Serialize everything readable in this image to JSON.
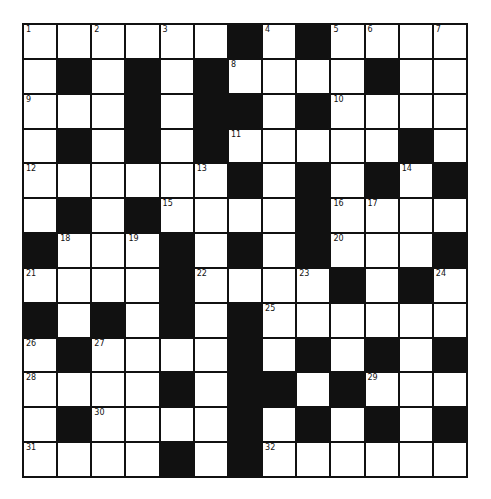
{
  "puzzle": {
    "rows": 13,
    "cols": 13,
    "colors": {
      "black": "#111111",
      "white": "#ffffff"
    },
    "layout": [
      "......#.#....",
      ".#.#.#....#.",
      "...#.##.#....",
      ".#.#.#.....#.",
      "......#.#.#.#",
      ".#.#....#....",
      "#...#.#.#...#",
      "....#....#.#.",
      "#.#.#.#......",
      ".#....#.#.#.#",
      "....#.##.#...",
      ".#....#.#.#.#",
      "....#.#......"
    ],
    "numbers": [
      {
        "r": 0,
        "c": 0,
        "n": "1"
      },
      {
        "r": 0,
        "c": 2,
        "n": "2"
      },
      {
        "r": 0,
        "c": 4,
        "n": "3"
      },
      {
        "r": 0,
        "c": 7,
        "n": "4"
      },
      {
        "r": 0,
        "c": 9,
        "n": "5"
      },
      {
        "r": 0,
        "c": 10,
        "n": "6"
      },
      {
        "r": 0,
        "c": 12,
        "n": "7"
      },
      {
        "r": 1,
        "c": 6,
        "n": "8"
      },
      {
        "r": 2,
        "c": 0,
        "n": "9"
      },
      {
        "r": 2,
        "c": 9,
        "n": "10"
      },
      {
        "r": 3,
        "c": 6,
        "n": "11"
      },
      {
        "r": 4,
        "c": 0,
        "n": "12"
      },
      {
        "r": 4,
        "c": 5,
        "n": "13"
      },
      {
        "r": 4,
        "c": 11,
        "n": "14"
      },
      {
        "r": 5,
        "c": 4,
        "n": "15"
      },
      {
        "r": 5,
        "c": 9,
        "n": "16"
      },
      {
        "r": 5,
        "c": 10,
        "n": "17"
      },
      {
        "r": 6,
        "c": 1,
        "n": "18"
      },
      {
        "r": 6,
        "c": 3,
        "n": "19"
      },
      {
        "r": 6,
        "c": 9,
        "n": "20"
      },
      {
        "r": 7,
        "c": 0,
        "n": "21"
      },
      {
        "r": 7,
        "c": 5,
        "n": "22"
      },
      {
        "r": 7,
        "c": 8,
        "n": "23"
      },
      {
        "r": 7,
        "c": 12,
        "n": "24"
      },
      {
        "r": 8,
        "c": 7,
        "n": "25"
      },
      {
        "r": 9,
        "c": 0,
        "n": "26"
      },
      {
        "r": 9,
        "c": 2,
        "n": "27"
      },
      {
        "r": 10,
        "c": 0,
        "n": "28"
      },
      {
        "r": 10,
        "c": 10,
        "n": "29"
      },
      {
        "r": 11,
        "c": 2,
        "n": "30"
      },
      {
        "r": 12,
        "c": 0,
        "n": "31"
      },
      {
        "r": 12,
        "c": 7,
        "n": "32"
      }
    ]
  }
}
